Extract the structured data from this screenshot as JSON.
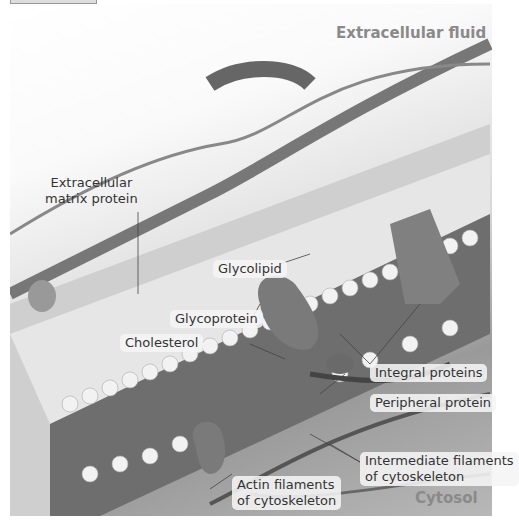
{
  "diagram": {
    "regions": {
      "top": "Extracellular fluid",
      "bottom": "Cytosol"
    },
    "labels": {
      "ecm_line1": "Extracellular",
      "ecm_line2": "matrix protein",
      "glycolipid": "Glycolipid",
      "glycoprotein": "Glycoprotein",
      "cholesterol": "Cholesterol",
      "integral": "Integral proteins",
      "peripheral": "Peripheral protein",
      "intermediate_line1": "Intermediate filaments",
      "intermediate_line2": "of cytoskeleton",
      "actin_line1": "Actin filaments",
      "actin_line2": "of cytoskeleton"
    },
    "colors": {
      "region_text": "#8a8a8a",
      "label_text": "#333333",
      "label_bg": "#f5f5f5"
    }
  }
}
